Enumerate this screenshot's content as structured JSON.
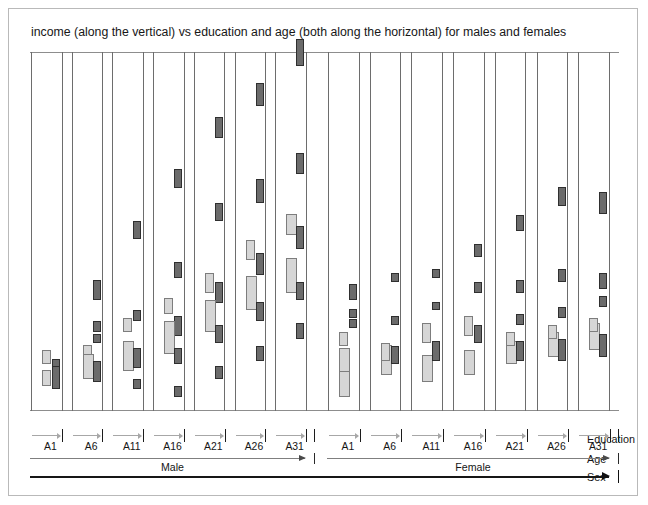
{
  "figure": {
    "title": "income (along the vertical) vs education and age (both along the horizontal) for males and females",
    "axis_names": {
      "education": "Education",
      "age": "Age",
      "sex": "Sex"
    },
    "sex_levels": [
      {
        "label": "Male"
      },
      {
        "label": "Female"
      }
    ],
    "education_ticks": [
      "A1",
      "A6",
      "A11",
      "A16",
      "A21",
      "A26",
      "A31"
    ],
    "colors": {
      "mark_dark_fill": "#6b6b6b",
      "mark_dark_stroke": "#2f2f2f",
      "mark_light_fill": "#d6d6d6",
      "mark_light_stroke": "#7d7d7d",
      "panel_stroke": "#6d6d6d",
      "frame_stroke": "#b9b9b9",
      "axis_dark": "#161616",
      "axis_gray": "#a7a7a7"
    }
  },
  "chart_data": {
    "type": "scatter",
    "title": "income (along the vertical) vs education and age (both along the horizontal) for males and females",
    "xlabel": "education and age (both along the horizontal)",
    "ylabel": "income (along the vertical)",
    "grid": false,
    "legend": "none",
    "encoding": {
      "x_outer": "sex",
      "x_mid": "age",
      "x_inner": "education",
      "y": "income",
      "mark": "rectangle spans (dark = one series, light = other series)"
    },
    "ylim": [
      0,
      100
    ],
    "nested_axes": [
      {
        "name": "Sex",
        "levels": [
          "Male",
          "Female"
        ]
      },
      {
        "name": "Age",
        "levels": [
          "Male range",
          "Female range"
        ]
      },
      {
        "name": "Education",
        "levels": [
          "A1",
          "A6",
          "A11",
          "A16",
          "A21",
          "A26",
          "A31"
        ]
      }
    ],
    "panels": [
      {
        "sex": "Male",
        "education": "A1",
        "marks": [
          {
            "series": "dark",
            "y": 10,
            "h": 4.5
          },
          {
            "series": "light",
            "y": 7,
            "h": 4.5
          },
          {
            "series": "dark",
            "y": 6,
            "h": 6.5
          },
          {
            "series": "light",
            "y": 13,
            "h": 4.0
          }
        ]
      },
      {
        "sex": "Male",
        "education": "A6",
        "marks": [
          {
            "series": "dark",
            "y": 31,
            "h": 5.5
          },
          {
            "series": "dark",
            "y": 22,
            "h": 3.0
          },
          {
            "series": "dark",
            "y": 19,
            "h": 2.5
          },
          {
            "series": "light",
            "y": 15,
            "h": 3.5
          },
          {
            "series": "light",
            "y": 9,
            "h": 7.0
          },
          {
            "series": "dark",
            "y": 8,
            "h": 6.0
          }
        ]
      },
      {
        "sex": "Male",
        "education": "A11",
        "marks": [
          {
            "series": "dark",
            "y": 48,
            "h": 5.0
          },
          {
            "series": "dark",
            "y": 25,
            "h": 3.0
          },
          {
            "series": "light",
            "y": 22,
            "h": 4.0
          },
          {
            "series": "light",
            "y": 11,
            "h": 8.5
          },
          {
            "series": "dark",
            "y": 12,
            "h": 5.5
          },
          {
            "series": "dark",
            "y": 6,
            "h": 3.0
          }
        ]
      },
      {
        "sex": "Male",
        "education": "A16",
        "marks": [
          {
            "series": "dark",
            "y": 62,
            "h": 5.5
          },
          {
            "series": "dark",
            "y": 37,
            "h": 4.5
          },
          {
            "series": "light",
            "y": 27,
            "h": 4.5
          },
          {
            "series": "dark",
            "y": 21,
            "h": 5.5
          },
          {
            "series": "light",
            "y": 16,
            "h": 9.0
          },
          {
            "series": "dark",
            "y": 13,
            "h": 4.5
          },
          {
            "series": "dark",
            "y": 4,
            "h": 3.0
          }
        ]
      },
      {
        "sex": "Male",
        "education": "A21",
        "marks": [
          {
            "series": "dark",
            "y": 76,
            "h": 6.0
          },
          {
            "series": "dark",
            "y": 53,
            "h": 5.0
          },
          {
            "series": "light",
            "y": 33,
            "h": 5.5
          },
          {
            "series": "dark",
            "y": 30,
            "h": 6.0
          },
          {
            "series": "light",
            "y": 22,
            "h": 9.0
          },
          {
            "series": "dark",
            "y": 19,
            "h": 5.0
          },
          {
            "series": "dark",
            "y": 9,
            "h": 3.5
          }
        ]
      },
      {
        "sex": "Male",
        "education": "A26",
        "marks": [
          {
            "series": "dark",
            "y": 85,
            "h": 6.5
          },
          {
            "series": "dark",
            "y": 58,
            "h": 6.5
          },
          {
            "series": "light",
            "y": 42,
            "h": 5.5
          },
          {
            "series": "dark",
            "y": 38,
            "h": 6.0
          },
          {
            "series": "light",
            "y": 28,
            "h": 9.5
          },
          {
            "series": "dark",
            "y": 25,
            "h": 5.5
          },
          {
            "series": "dark",
            "y": 14,
            "h": 4.0
          }
        ]
      },
      {
        "sex": "Male",
        "education": "A31",
        "marks": [
          {
            "series": "dark",
            "y": 96,
            "h": 7.5
          },
          {
            "series": "dark",
            "y": 66,
            "h": 6.0
          },
          {
            "series": "light",
            "y": 49,
            "h": 6.0
          },
          {
            "series": "dark",
            "y": 45,
            "h": 6.5
          },
          {
            "series": "light",
            "y": 33,
            "h": 9.5
          },
          {
            "series": "dark",
            "y": 31,
            "h": 5.0
          },
          {
            "series": "dark",
            "y": 20,
            "h": 4.5
          }
        ]
      },
      {
        "sex": "Female",
        "education": "A1",
        "marks": [
          {
            "series": "light",
            "y": 4,
            "h": 9.0
          },
          {
            "series": "light",
            "y": 11,
            "h": 6.5
          },
          {
            "series": "light",
            "y": 18,
            "h": 4.0
          },
          {
            "series": "dark",
            "y": 23,
            "h": 2.5
          },
          {
            "series": "dark",
            "y": 26,
            "h": 2.5
          },
          {
            "series": "dark",
            "y": 31,
            "h": 4.5
          }
        ]
      },
      {
        "sex": "Female",
        "education": "A6",
        "marks": [
          {
            "series": "light",
            "y": 10,
            "h": 8.5
          },
          {
            "series": "light",
            "y": 14,
            "h": 5.0
          },
          {
            "series": "dark",
            "y": 13,
            "h": 5.0
          },
          {
            "series": "dark",
            "y": 24,
            "h": 2.5
          },
          {
            "series": "dark",
            "y": 36,
            "h": 2.5
          }
        ]
      },
      {
        "sex": "Female",
        "education": "A11",
        "marks": [
          {
            "series": "light",
            "y": 8,
            "h": 7.5
          },
          {
            "series": "dark",
            "y": 14,
            "h": 5.5
          },
          {
            "series": "light",
            "y": 19,
            "h": 5.5
          },
          {
            "series": "dark",
            "y": 28,
            "h": 2.5
          },
          {
            "series": "dark",
            "y": 37,
            "h": 2.5
          }
        ]
      },
      {
        "sex": "Female",
        "education": "A16",
        "marks": [
          {
            "series": "light",
            "y": 10,
            "h": 7.0
          },
          {
            "series": "dark",
            "y": 19,
            "h": 5.0
          },
          {
            "series": "light",
            "y": 21,
            "h": 5.5
          },
          {
            "series": "dark",
            "y": 33,
            "h": 3.0
          },
          {
            "series": "dark",
            "y": 43,
            "h": 3.5
          }
        ]
      },
      {
        "sex": "Female",
        "education": "A21",
        "marks": [
          {
            "series": "light",
            "y": 13,
            "h": 6.5
          },
          {
            "series": "light",
            "y": 18,
            "h": 4.0
          },
          {
            "series": "dark",
            "y": 14,
            "h": 5.5
          },
          {
            "series": "dark",
            "y": 24,
            "h": 3.0
          },
          {
            "series": "dark",
            "y": 33,
            "h": 3.5
          },
          {
            "series": "dark",
            "y": 50,
            "h": 4.5
          }
        ]
      },
      {
        "sex": "Female",
        "education": "A26",
        "marks": [
          {
            "series": "light",
            "y": 15,
            "h": 7.0
          },
          {
            "series": "light",
            "y": 20,
            "h": 4.0
          },
          {
            "series": "dark",
            "y": 14,
            "h": 6.0
          },
          {
            "series": "dark",
            "y": 26,
            "h": 3.0
          },
          {
            "series": "dark",
            "y": 36,
            "h": 3.5
          },
          {
            "series": "dark",
            "y": 57,
            "h": 5.5
          }
        ]
      },
      {
        "sex": "Female",
        "education": "A31",
        "marks": [
          {
            "series": "light",
            "y": 17,
            "h": 7.5
          },
          {
            "series": "light",
            "y": 22,
            "h": 4.0
          },
          {
            "series": "dark",
            "y": 15,
            "h": 6.5
          },
          {
            "series": "dark",
            "y": 29,
            "h": 3.0
          },
          {
            "series": "dark",
            "y": 34,
            "h": 4.5
          },
          {
            "series": "dark",
            "y": 55,
            "h": 6.0
          }
        ]
      }
    ]
  }
}
